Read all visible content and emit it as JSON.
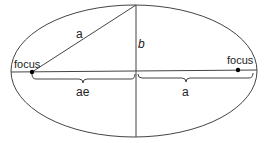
{
  "diagram": {
    "labels": {
      "left_focus": "focus",
      "right_focus": "focus",
      "hypotenuse": "a",
      "semi_minor": "b",
      "focal_distance": "ae",
      "semi_major": "a"
    },
    "colors": {
      "stroke": "#333333",
      "focus_dot": "#000000",
      "background": "#ffffff"
    }
  }
}
